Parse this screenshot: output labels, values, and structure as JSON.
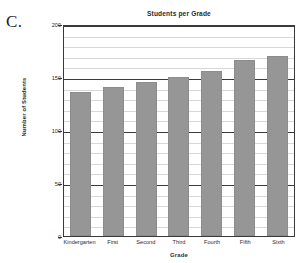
{
  "panel": {
    "letter": "C."
  },
  "chart_data": {
    "type": "bar",
    "title": "Students per Grade",
    "xlabel": "Grade",
    "ylabel": "Number of Students",
    "categories": [
      "Kindergarten",
      "First",
      "Second",
      "Third",
      "Fourth",
      "Fifth",
      "Sixth"
    ],
    "values": [
      136,
      141,
      145,
      150,
      156,
      166,
      170
    ],
    "ylim": [
      0,
      200
    ],
    "ytick_labels": [
      "0",
      "50",
      "100",
      "150",
      "200"
    ],
    "ytick_values": [
      0,
      50,
      100,
      150,
      200
    ],
    "minor_tick_step": 10,
    "grid": true,
    "legend": null,
    "bar_color": "#969696",
    "axis_color": "#3a3a3a",
    "minor_grid_color": "#d8d8d8"
  }
}
